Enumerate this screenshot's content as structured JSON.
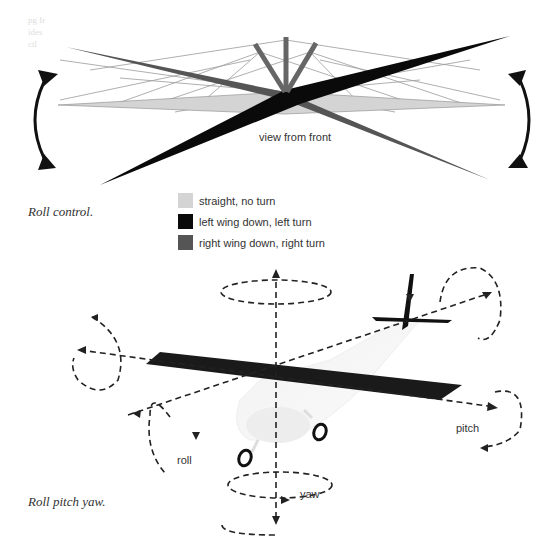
{
  "figure1": {
    "caption": "Roll control.",
    "view_label": "view from front",
    "legend": [
      {
        "label": "straight, no turn",
        "color": "#d4d4d4"
      },
      {
        "label": "left wing down, left turn",
        "color": "#0a0a0a"
      },
      {
        "label": "right wing down, right turn",
        "color": "#555555"
      }
    ],
    "icons": [
      "roll-arrow-left-icon",
      "roll-arrow-right-icon"
    ]
  },
  "figure2": {
    "caption": "Roll pitch yaw.",
    "axis_labels": {
      "roll": "roll",
      "pitch": "pitch",
      "yaw": "yaw"
    }
  },
  "faint_text": [
    "pg Ir",
    "ides",
    "ctl"
  ]
}
